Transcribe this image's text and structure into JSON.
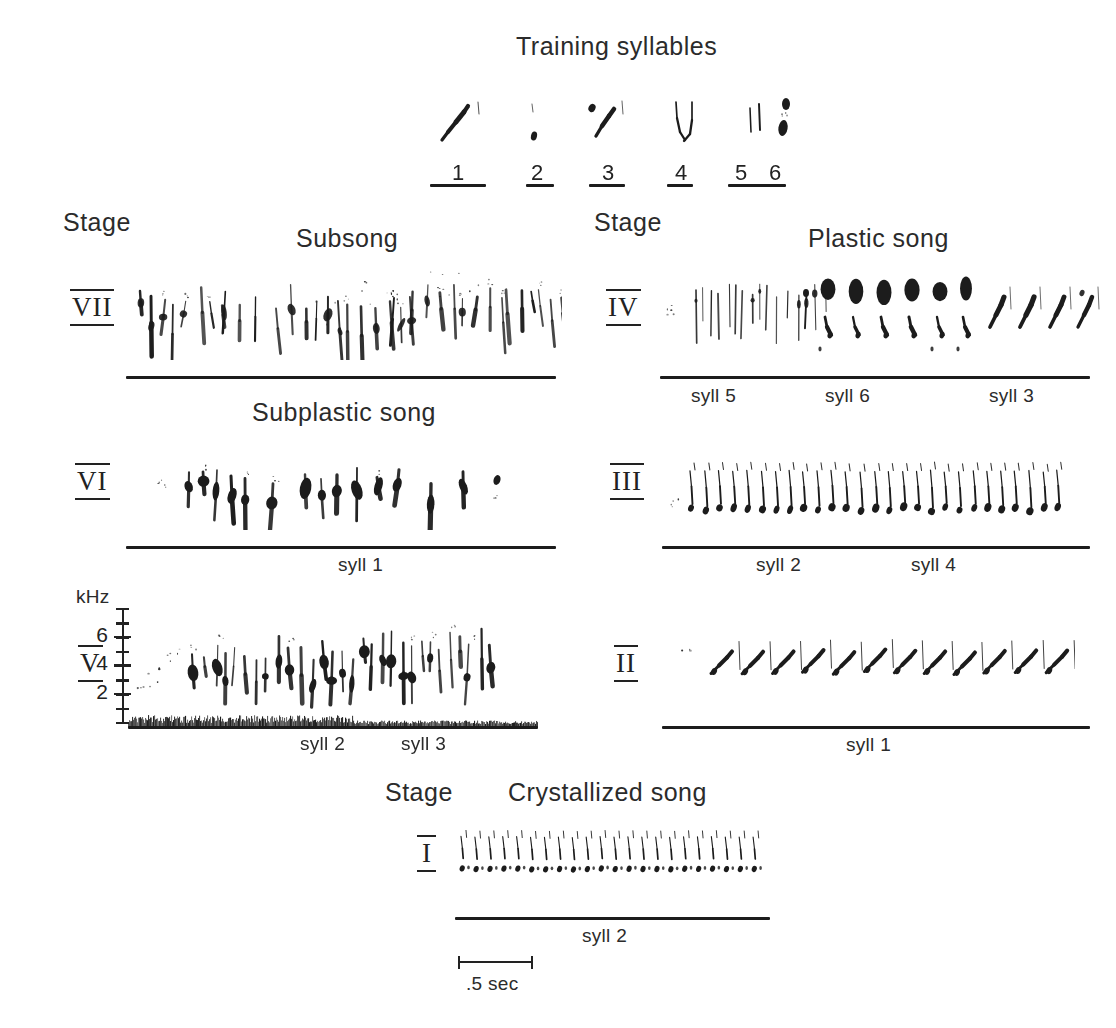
{
  "figure": {
    "title": "Training syllables",
    "background": "#ffffff",
    "ink": "#1c1c1c"
  },
  "training": {
    "heading": "Training syllables",
    "syllables": [
      {
        "number": "1",
        "shape": "rising-stroke"
      },
      {
        "number": "2",
        "shape": "short-dot-pair"
      },
      {
        "number": "3",
        "shape": "steep-rising-stroke"
      },
      {
        "number": "4",
        "shape": "descending-hook"
      },
      {
        "number": "5",
        "shape": "vertical-pair"
      },
      {
        "number": "6",
        "shape": "blob-pair"
      }
    ]
  },
  "columns": {
    "left_stage_heading": "Stage",
    "right_stage_heading": "Stage",
    "bottom_stage_heading": "Stage"
  },
  "section_headings": {
    "subsong": "Subsong",
    "subplastic": "Subplastic song",
    "plastic": "Plastic song",
    "crystallized": "Crystallized song"
  },
  "axis": {
    "unit_label": "kHz",
    "tick_labels": [
      "6",
      "4",
      "2"
    ],
    "tick_values": [
      6,
      4,
      2
    ],
    "minor_ticks": 9,
    "range": [
      0,
      8
    ]
  },
  "scale": {
    "label": ".5 sec",
    "seconds": 0.5
  },
  "panels": [
    {
      "id": "stage-7",
      "stage": "VII",
      "song_type": "Subsong",
      "column": "left",
      "syll_labels": []
    },
    {
      "id": "stage-6",
      "stage": "VI",
      "song_type": "Subplastic song",
      "column": "left",
      "syll_labels": [
        {
          "text": "syll 1",
          "x_frac": 0.53
        }
      ]
    },
    {
      "id": "stage-5",
      "stage": "V",
      "song_type": "Subplastic song",
      "column": "left",
      "has_axis": true,
      "syll_labels": [
        {
          "text": "syll 2",
          "x_frac": 0.5
        },
        {
          "text": "syll 3",
          "x_frac": 0.755
        }
      ]
    },
    {
      "id": "stage-4",
      "stage": "IV",
      "song_type": "Plastic song",
      "column": "right",
      "syll_labels": [
        {
          "text": "syll 5",
          "x_frac": 0.155
        },
        {
          "text": "syll 6",
          "x_frac": 0.46
        },
        {
          "text": "syll 3",
          "x_frac": 0.845
        }
      ]
    },
    {
      "id": "stage-3",
      "stage": "III",
      "song_type": "Plastic song",
      "column": "right",
      "syll_labels": [
        {
          "text": "syll 2",
          "x_frac": 0.345
        },
        {
          "text": "syll 4",
          "x_frac": 0.79
        }
      ]
    },
    {
      "id": "stage-2",
      "stage": "II",
      "song_type": "Plastic song",
      "column": "right",
      "syll_labels": [
        {
          "text": "syll 1",
          "x_frac": 0.5
        }
      ]
    },
    {
      "id": "stage-1",
      "stage": "I",
      "song_type": "Crystallized song",
      "column": "bottom",
      "syll_labels": [
        {
          "text": "syll 2",
          "x_frac": 0.5
        }
      ]
    }
  ],
  "chart_data": {
    "type": "spectrogram-panels",
    "title": "Training syllables",
    "xlabel": "time",
    "ylabel": "kHz",
    "ylim": [
      0,
      8
    ],
    "yticks": [
      2,
      4,
      6
    ],
    "time_scale_sec": 0.5,
    "grid": false,
    "legend": "none",
    "stage_order": [
      "VII",
      "VI",
      "V",
      "IV",
      "III",
      "II",
      "I"
    ],
    "stage_song_types": {
      "VII": "Subsong",
      "VI": "Subplastic song",
      "V": "Subplastic song",
      "IV": "Plastic song",
      "III": "Plastic song",
      "II": "Plastic song",
      "I": "Crystallized song"
    },
    "annotations": [
      "Subsong",
      "Subplastic song",
      "Plastic song",
      "Crystallized song",
      "syll 1",
      "syll 2",
      "syll 3",
      "syll 4",
      "syll 5",
      "syll 6",
      ".5 sec",
      "kHz"
    ],
    "training_syllable_numbers": [
      "1",
      "2",
      "3",
      "4",
      "5",
      "6"
    ],
    "series": [
      {
        "name": "stage-7-subsong",
        "regularity": 0.05,
        "elements": 46,
        "freq_center": 4.0,
        "freq_spread": 2.4
      },
      {
        "name": "stage-6-subplastic",
        "regularity": 0.18,
        "elements": 26,
        "freq_center": 4.2,
        "freq_spread": 2.0
      },
      {
        "name": "stage-5-subplastic",
        "regularity": 0.25,
        "elements": 40,
        "freq_center": 3.8,
        "freq_spread": 2.2
      },
      {
        "name": "stage-4-plastic",
        "regularity": 0.55,
        "elements": 34,
        "freq_center": 4.6,
        "freq_spread": 1.8
      },
      {
        "name": "stage-3-plastic",
        "regularity": 0.85,
        "elements": 28,
        "freq_center": 4.4,
        "freq_spread": 1.2
      },
      {
        "name": "stage-2-plastic",
        "regularity": 0.8,
        "elements": 13,
        "freq_center": 4.2,
        "freq_spread": 1.5
      },
      {
        "name": "stage-1-crystallized",
        "regularity": 0.98,
        "elements": 22,
        "freq_center": 4.5,
        "freq_spread": 1.0
      }
    ]
  }
}
